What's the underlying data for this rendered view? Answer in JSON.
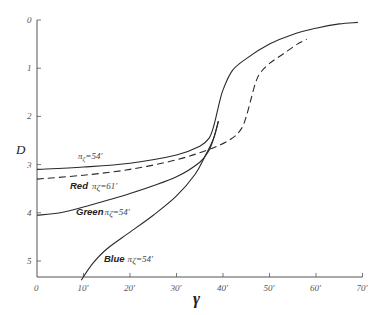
{
  "chart_data": {
    "type": "line",
    "title": "",
    "xlabel": "γ",
    "ylabel": "D",
    "xlim": [
      0,
      70
    ],
    "ylim": [
      5.4,
      0
    ],
    "y_inverted": true,
    "grid": false,
    "x_ticks": [
      "0",
      "10′",
      "20′",
      "30′",
      "40′",
      "50′",
      "60′",
      "70′"
    ],
    "y_ticks": [
      "0",
      "1",
      "2",
      "3",
      "4",
      "5"
    ],
    "series": [
      {
        "name": "π_ζ = 54′ (white)",
        "label": "π",
        "label_sub": "ζ",
        "label_val": "=54′",
        "style": "solid",
        "x": [
          0,
          10,
          20,
          30,
          35,
          37,
          38,
          39,
          40,
          42,
          45,
          50,
          55,
          60,
          65,
          69
        ],
        "y": [
          3.1,
          3.05,
          2.97,
          2.8,
          2.62,
          2.45,
          2.2,
          1.8,
          1.45,
          1.05,
          0.8,
          0.5,
          0.3,
          0.17,
          0.08,
          0.05
        ]
      },
      {
        "name": "Red π_ζ = 61′",
        "label": "Red",
        "label_sub": "ζ",
        "label_val": "=61′",
        "style": "dashed",
        "x": [
          0,
          10,
          20,
          30,
          38,
          42,
          44,
          45,
          46,
          47,
          48,
          50,
          53,
          56,
          58
        ],
        "y": [
          3.3,
          3.22,
          3.1,
          2.9,
          2.65,
          2.45,
          2.25,
          2.0,
          1.65,
          1.3,
          1.1,
          0.9,
          0.7,
          0.5,
          0.4
        ]
      },
      {
        "name": "Green π_ζ = 54′",
        "label": "Green",
        "label_sub": "ζ",
        "label_val": "=54′",
        "style": "solid",
        "x": [
          0,
          5,
          10,
          20,
          30,
          35,
          37,
          38,
          39
        ],
        "y": [
          4.05,
          4.0,
          3.88,
          3.6,
          3.25,
          2.95,
          2.7,
          2.45,
          2.1
        ]
      },
      {
        "name": "Blue π_ζ = 54′",
        "label": "Blue",
        "label_sub": "ζ",
        "label_val": "=54′",
        "style": "solid",
        "x": [
          9.5,
          12,
          15,
          20,
          25,
          30,
          34,
          36,
          38,
          39
        ],
        "y": [
          5.4,
          5.05,
          4.75,
          4.4,
          4.05,
          3.65,
          3.2,
          2.85,
          2.45,
          2.1
        ]
      }
    ],
    "annotations": [
      {
        "text": "π",
        "sub": "ζ",
        "val": "=54′",
        "near_series": 0
      },
      {
        "text": "Red π",
        "sub": "ζ",
        "val": "=61′",
        "near_series": 1
      },
      {
        "text": "Green π",
        "sub": "ζ",
        "val": "=54′",
        "near_series": 2
      },
      {
        "text": "Blue π",
        "sub": "ζ",
        "val": "=54′",
        "near_series": 3
      }
    ]
  },
  "labels": {
    "y_axis_title": "D",
    "x_axis_title": "γ",
    "white_label_sym": "π",
    "white_label_sub": "ζ",
    "white_label_val": "=54′",
    "red_label_word": "Red",
    "red_label_sym": "π",
    "red_label_sub": "ζ",
    "red_label_val": "=61′",
    "green_label_word": "Green",
    "green_label_sym": "π",
    "green_label_sub": "ζ",
    "green_label_val": "=54′",
    "blue_label_word": "Blue",
    "blue_label_sym": "π",
    "blue_label_sub": "ζ",
    "blue_label_val": "=54′"
  },
  "colors": {
    "axis": "#555555",
    "line": "#2a2a2a",
    "background": "#ffffff"
  }
}
